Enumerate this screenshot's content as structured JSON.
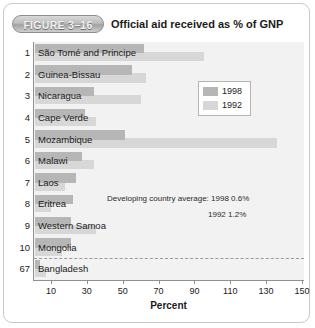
{
  "figure": {
    "badge_label": "FIGURE 3–16",
    "title": "Official aid received as % of GNP"
  },
  "legend": {
    "entries": [
      {
        "label": "1998",
        "color": "#b6b6b6"
      },
      {
        "label": "1992",
        "color": "#d7d7d7"
      }
    ]
  },
  "annotation": {
    "line1": "Developing country average:  1998 0.6%",
    "line2": "1992 1.2%"
  },
  "colors": {
    "bar_1998": "#b6b6b6",
    "bar_1992": "#d7d7d7",
    "plot_background": "#f2f2f2",
    "axis": "#8f8f8f"
  },
  "chart_data": {
    "type": "bar",
    "orientation": "horizontal",
    "title": "Official aid received as % of GNP",
    "xlabel": "Percent",
    "ylabel": "",
    "xlim": [
      0,
      150
    ],
    "xticks": [
      10,
      30,
      50,
      70,
      90,
      110,
      130,
      150
    ],
    "grid": false,
    "legend_position": "top-right",
    "categories": [
      "São Tomé and Principe",
      "Guinea-Bissau",
      "Nicaragua",
      "Cape Verde",
      "Mozambique",
      "Malawi",
      "Laos",
      "Eritrea",
      "Western Samoa",
      "Mongolia",
      "Bangladesh"
    ],
    "ranks": [
      "1",
      "2",
      "3",
      "4",
      "5",
      "6",
      "7",
      "8",
      "9",
      "10",
      "67"
    ],
    "series": [
      {
        "name": "1998",
        "values": [
          61,
          54,
          33,
          28,
          50,
          26,
          23,
          21,
          20,
          20,
          3
        ]
      },
      {
        "name": "1992",
        "values": [
          94,
          62,
          59,
          34,
          135,
          33,
          17,
          9,
          34,
          15,
          6
        ]
      }
    ],
    "annotations": [
      "Developing country average:  1998 0.6%",
      "1992 1.2%"
    ],
    "separator_after_rank": "10"
  }
}
